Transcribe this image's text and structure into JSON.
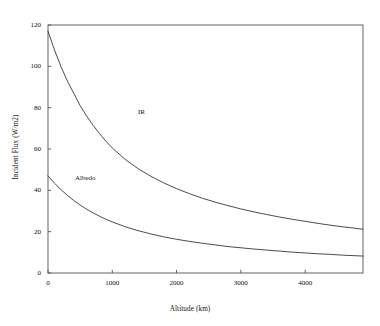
{
  "chart_data": {
    "type": "line",
    "title": "",
    "xlabel": "Altitude (km)",
    "ylabel": "Incident Flux (W/m2)",
    "xlim": [
      0,
      4900
    ],
    "ylim": [
      0,
      120
    ],
    "xticks": [
      0,
      1000,
      2000,
      3000,
      4000
    ],
    "yticks": [
      0,
      20,
      40,
      60,
      80,
      100,
      120
    ],
    "xtick_labels": [
      "0",
      "1000",
      "2000",
      "3000",
      "4000"
    ],
    "ytick_labels": [
      "0",
      "20",
      "40",
      "60",
      "80",
      "100",
      "120"
    ],
    "grid": false,
    "legend": "inline-annotations",
    "line_color": "#2b2b2b",
    "frame_color": "#555555",
    "series": [
      {
        "name": "IR",
        "label_x": 1400,
        "label_y": 78,
        "x": [
          0,
          100,
          200,
          300,
          400,
          500,
          600,
          700,
          800,
          900,
          1000,
          1200,
          1400,
          1600,
          1800,
          2000,
          2200,
          2400,
          2600,
          2800,
          3000,
          3200,
          3400,
          3600,
          3800,
          4000,
          4200,
          4400,
          4600,
          4900
        ],
        "y": [
          117,
          108,
          100,
          93,
          87,
          81,
          76,
          71.5,
          67.5,
          63.8,
          60.5,
          55,
          50.5,
          46.8,
          43.6,
          40.8,
          38.4,
          36.2,
          34.3,
          32.6,
          31,
          29.6,
          28.3,
          27.1,
          26,
          25,
          24,
          23.1,
          22.3,
          21.2
        ]
      },
      {
        "name": "Albedo",
        "label_x": 420,
        "label_y": 46,
        "x": [
          0,
          100,
          200,
          300,
          400,
          500,
          600,
          700,
          800,
          900,
          1000,
          1200,
          1400,
          1600,
          1800,
          2000,
          2200,
          2400,
          2600,
          2800,
          3000,
          3200,
          3400,
          3600,
          3800,
          4000,
          4200,
          4400,
          4600,
          4900
        ],
        "y": [
          47,
          43.5,
          40.4,
          37.6,
          35.1,
          32.9,
          30.9,
          29.1,
          27.5,
          26,
          24.7,
          22.4,
          20.5,
          18.9,
          17.5,
          16.3,
          15.3,
          14.4,
          13.6,
          12.8,
          12.2,
          11.6,
          11.1,
          10.6,
          10.1,
          9.7,
          9.3,
          9,
          8.6,
          8.2
        ]
      }
    ]
  }
}
